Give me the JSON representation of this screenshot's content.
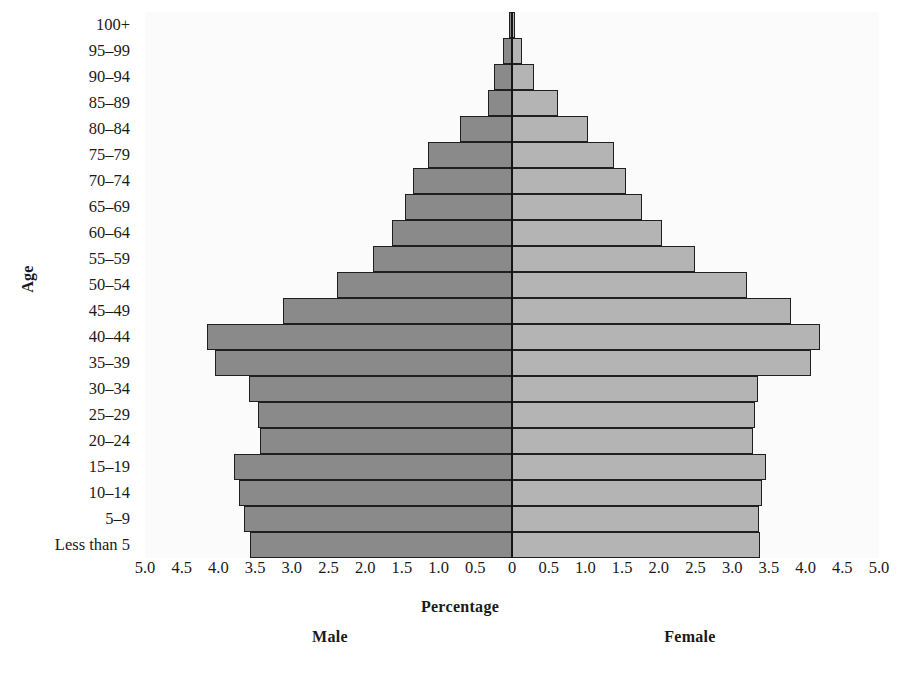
{
  "chart_data": {
    "type": "bar",
    "subtype": "population-pyramid",
    "title": "",
    "xlabel": "Percentage",
    "ylabel": "Age",
    "categories": [
      "100+",
      "95–99",
      "90–94",
      "85–89",
      "80–84",
      "75–79",
      "70–74",
      "65–69",
      "60–64",
      "55–59",
      "50–54",
      "45–49",
      "40–44",
      "35–39",
      "30–34",
      "25–29",
      "20–24",
      "15–19",
      "10–14",
      "5–9",
      "Less than 5"
    ],
    "series": [
      {
        "name": "Male",
        "color": "#8a8a8a",
        "direction": "left",
        "values": [
          0.04,
          0.12,
          0.25,
          0.33,
          0.71,
          1.15,
          1.35,
          1.46,
          1.63,
          1.9,
          2.38,
          3.12,
          4.15,
          4.05,
          3.58,
          3.46,
          3.43,
          3.79,
          3.72,
          3.65,
          3.57
        ]
      },
      {
        "name": "Female",
        "color": "#b4b4b4",
        "direction": "right",
        "values": [
          0.04,
          0.13,
          0.3,
          0.63,
          1.04,
          1.39,
          1.55,
          1.77,
          2.04,
          2.49,
          3.2,
          3.8,
          4.19,
          4.08,
          3.35,
          3.31,
          3.28,
          3.46,
          3.41,
          3.36,
          3.38
        ]
      }
    ],
    "x_tick_labels_left": [
      "5.0",
      "4.5",
      "4.0",
      "3.5",
      "3.0",
      "2.5",
      "2.0",
      "1.5",
      "1.0",
      "0.5",
      "0"
    ],
    "x_tick_labels_right": [
      "0",
      "0.5",
      "1.0",
      "1.5",
      "2.0",
      "2.5",
      "3.0",
      "3.5",
      "4.0",
      "4.5",
      "5.0"
    ],
    "xlim": [
      -5.0,
      5.0
    ],
    "x_tick_step": 0.5,
    "grid": false,
    "legend_position": "below-axis"
  },
  "axes": {
    "y_title": "Age",
    "x_title": "Percentage"
  },
  "legend": {
    "male_label": "Male",
    "female_label": "Female"
  }
}
